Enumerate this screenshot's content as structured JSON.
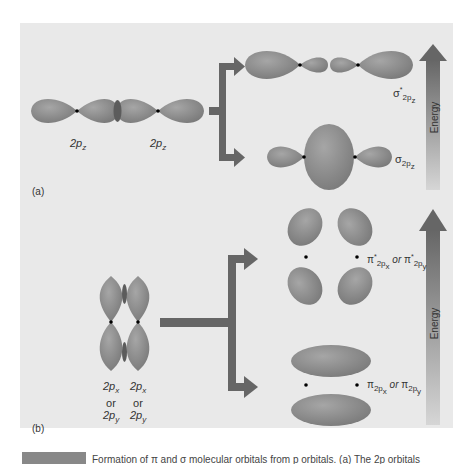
{
  "figure": {
    "panel_a": {
      "letter": "(a)",
      "left_orbital_label": "2p",
      "left_orbital_sub": "z",
      "right_orbital_label": "2p",
      "right_orbital_sub": "z",
      "antibonding_symbol": "σ",
      "antibonding_sup": "*",
      "antibonding_sub": "2p",
      "antibonding_subsub": "z",
      "bonding_symbol": "σ",
      "bonding_sub": "2p",
      "bonding_subsub": "z",
      "energy_label": "Energy"
    },
    "panel_b": {
      "letter": "(b)",
      "left_label": [
        "2p",
        "x",
        "or",
        "2p",
        "y"
      ],
      "right_label": [
        "2p",
        "x",
        "or",
        "2p",
        "y"
      ],
      "antibonding_text": {
        "symbol": "π",
        "sup": "*",
        "sub": "2p",
        "x": "x",
        "or": "or",
        "y": "y"
      },
      "bonding_text": {
        "symbol": "π",
        "sub": "2p",
        "x": "x",
        "or": "or",
        "y": "y"
      },
      "energy_label": "Energy"
    },
    "caption": "Formation of π and σ molecular orbitals from p orbitals. (a) The 2p orbitals"
  },
  "colors": {
    "background": "#e9e9e9",
    "lobe": "#8d8d8d",
    "lobe_dark": "#6f6f6f",
    "arrow": "#666666",
    "energy_top": "#6a6a6a",
    "energy_bottom": "#cfcfcf"
  }
}
